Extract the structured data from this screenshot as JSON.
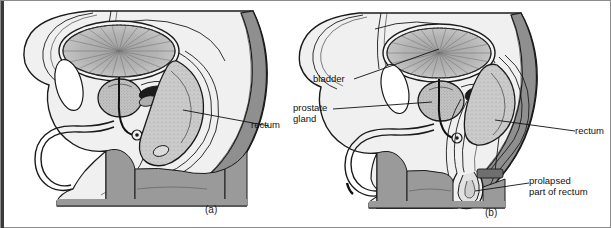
{
  "figure": {
    "kind": "medical-illustration",
    "panel_count": 2
  },
  "panels": [
    {
      "id": "a",
      "caption": "(a)",
      "labels": [
        {
          "id": "rectum-a",
          "text": "rectum"
        }
      ]
    },
    {
      "id": "b",
      "caption": "(b)",
      "labels": [
        {
          "id": "bladder-b",
          "text": "bladder"
        },
        {
          "id": "prostate-b-line1",
          "text": "prostate"
        },
        {
          "id": "prostate-b-line2",
          "text": "gland"
        },
        {
          "id": "rectum-b",
          "text": "rectum"
        },
        {
          "id": "prolapse-b-line1",
          "text": "prolapsed"
        },
        {
          "id": "prolapse-b-line2",
          "text": "part of rectum"
        }
      ]
    }
  ],
  "colors": {
    "page_background": "#ffffff",
    "frame_border": "#8c8c8c",
    "left_bar": "#3a3a3a",
    "body_fill": "#f0f0f0",
    "body_fill_alt": "#e8e8e8",
    "muscle_gray": "#9a9a9a",
    "sacrum_gray": "#8f8f8f",
    "organ_gray": "#b3b3b3",
    "organ_gray_dark": "#a0a0a0",
    "bone_white": "#ffffff",
    "outline": "#1a1a1a",
    "label_text": "#111111"
  }
}
